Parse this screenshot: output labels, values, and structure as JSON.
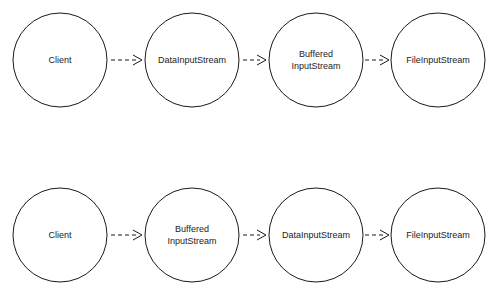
{
  "diagram": {
    "type": "flow-chain",
    "background_color": "#ffffff",
    "stroke_color": "#1a1a1a",
    "node_shape": "circle",
    "edge_style": "dashed-arrow",
    "rows": [
      {
        "name": "chain-row-1",
        "nodes": [
          {
            "id": "r1n1",
            "lines": [
              "Client"
            ],
            "cx": 60,
            "cy": 60,
            "r": 47
          },
          {
            "id": "r1n2",
            "lines": [
              "DataInputStream"
            ],
            "cx": 192,
            "cy": 60,
            "r": 47
          },
          {
            "id": "r1n3",
            "lines": [
              "Buffered",
              "InputStream"
            ],
            "cx": 316,
            "cy": 60,
            "r": 47
          },
          {
            "id": "r1n4",
            "lines": [
              "FileInputStream"
            ],
            "cx": 438,
            "cy": 60,
            "r": 47
          }
        ],
        "edges": [
          {
            "id": "r1e1",
            "from": "r1n1",
            "to": "r1n2",
            "x1": 110,
            "x2": 142,
            "y": 60
          },
          {
            "id": "r1e2",
            "from": "r1n2",
            "to": "r1n3",
            "x1": 242,
            "x2": 266,
            "y": 60
          },
          {
            "id": "r1e3",
            "from": "r1n3",
            "to": "r1n4",
            "x1": 365,
            "x2": 389,
            "y": 60
          }
        ]
      },
      {
        "name": "chain-row-2",
        "nodes": [
          {
            "id": "r2n1",
            "lines": [
              "Client"
            ],
            "cx": 60,
            "cy": 235,
            "r": 47
          },
          {
            "id": "r2n2",
            "lines": [
              "Buffered",
              "InputStream"
            ],
            "cx": 192,
            "cy": 235,
            "r": 47
          },
          {
            "id": "r2n3",
            "lines": [
              "DataInputStream"
            ],
            "cx": 316,
            "cy": 235,
            "r": 47
          },
          {
            "id": "r2n4",
            "lines": [
              "FileInputStream"
            ],
            "cx": 438,
            "cy": 235,
            "r": 47
          }
        ],
        "edges": [
          {
            "id": "r2e1",
            "from": "r2n1",
            "to": "r2n2",
            "x1": 110,
            "x2": 142,
            "y": 235
          },
          {
            "id": "r2e2",
            "from": "r2n2",
            "to": "r2n3",
            "x1": 242,
            "x2": 266,
            "y": 235
          },
          {
            "id": "r2e3",
            "from": "r2n3",
            "to": "r2n4",
            "x1": 365,
            "x2": 389,
            "y": 235
          }
        ]
      }
    ]
  },
  "labels": {
    "r1n1_l1": "Client",
    "r1n2_l1": "DataInputStream",
    "r1n3_l1": "Buffered",
    "r1n3_l2": "InputStream",
    "r1n4_l1": "FileInputStream",
    "r2n1_l1": "Client",
    "r2n2_l1": "Buffered",
    "r2n2_l2": "InputStream",
    "r2n3_l1": "DataInputStream",
    "r2n4_l1": "FileInputStream"
  }
}
